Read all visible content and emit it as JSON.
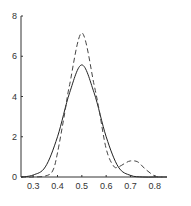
{
  "chart_data": {
    "type": "line",
    "title": "",
    "xlabel": "",
    "ylabel": "",
    "xlim": [
      0.25,
      0.85
    ],
    "ylim": [
      0,
      8
    ],
    "grid": false,
    "legend": null,
    "x_ticks": [
      "0.3",
      "0.4",
      "0.5",
      "0.6",
      "0.7",
      "0.8"
    ],
    "y_ticks": [
      "0",
      "2",
      "4",
      "6",
      "8"
    ],
    "series": [
      {
        "name": "solid",
        "style": "solid",
        "color": "#222222",
        "x": [
          0.25,
          0.3,
          0.35,
          0.4,
          0.45,
          0.5,
          0.55,
          0.6,
          0.65,
          0.7,
          0.75,
          0.8,
          0.85
        ],
        "values": [
          0.0,
          0.1,
          0.5,
          2.0,
          4.2,
          5.57,
          4.2,
          2.0,
          0.5,
          0.08,
          0.0,
          0.0,
          0.0
        ]
      },
      {
        "name": "dashed",
        "style": "dashed",
        "color": "#444444",
        "x": [
          0.25,
          0.3,
          0.35,
          0.38,
          0.4,
          0.43,
          0.45,
          0.5,
          0.55,
          0.57,
          0.6,
          0.63,
          0.65,
          0.68,
          0.7,
          0.73,
          0.76,
          0.8,
          0.83
        ],
        "values": [
          0.0,
          0.0,
          0.05,
          0.3,
          1.2,
          3.2,
          4.6,
          7.16,
          4.6,
          3.4,
          1.4,
          0.55,
          0.5,
          0.7,
          0.8,
          0.75,
          0.4,
          0.05,
          0.0
        ]
      }
    ]
  }
}
